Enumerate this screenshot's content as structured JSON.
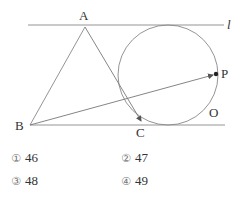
{
  "figure": {
    "colors": {
      "stroke": "#888888",
      "text": "#333333",
      "point": "#222222"
    },
    "line_l": {
      "label": "l",
      "x1": 28,
      "x2": 224,
      "y": 25
    },
    "line_bottom": {
      "x1": 30,
      "x2": 225,
      "y": 125
    },
    "points": {
      "A": {
        "label": "A",
        "x": 85,
        "y": 27
      },
      "B": {
        "label": "B",
        "x": 30,
        "y": 125
      },
      "C": {
        "label": "C",
        "x": 141,
        "y": 123
      },
      "P": {
        "label": "P",
        "x": 216,
        "y": 74
      },
      "O": {
        "label": "O"
      }
    },
    "circle": {
      "cx": 168,
      "cy": 75,
      "r": 50
    }
  },
  "options": [
    {
      "number": "①",
      "value": "46"
    },
    {
      "number": "②",
      "value": "47"
    },
    {
      "number": "③",
      "value": "48"
    },
    {
      "number": "④",
      "value": "49"
    }
  ]
}
